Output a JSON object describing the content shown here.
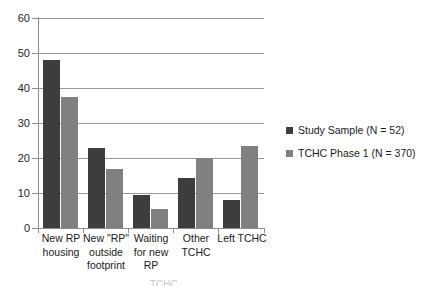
{
  "chart_data": {
    "type": "bar",
    "title": "",
    "xlabel": "",
    "ylabel": "",
    "ylim": [
      0,
      60
    ],
    "yticks": [
      0,
      10,
      20,
      30,
      40,
      50,
      60
    ],
    "grid": true,
    "legend_position": "right",
    "categories": [
      "New RP housing",
      "New \"RP\" outside footprint",
      "Waiting for new RP",
      "Other TCHC",
      "Left TCHC"
    ],
    "category_lines": [
      [
        "New RP",
        "housing"
      ],
      [
        "New \"RP\"",
        "outside",
        "footprint"
      ],
      [
        "Waiting",
        "for new",
        "RP"
      ],
      [
        "Other",
        "TCHC"
      ],
      [
        "Left TCHC"
      ]
    ],
    "series": [
      {
        "name": "Study Sample (N = 52)",
        "color": "#3d3d3d",
        "values": [
          48,
          23,
          9.5,
          14.3,
          8
        ]
      },
      {
        "name": "TCHC Phase 1 (N = 370)",
        "color": "#808080",
        "values": [
          37.5,
          17,
          5.5,
          20,
          23.3
        ]
      }
    ]
  },
  "legend": {
    "items": [
      {
        "label": "Study Sample (N = 52)",
        "color": "#3d3d3d"
      },
      {
        "label": "TCHC Phase 1 (N = 370)",
        "color": "#808080"
      }
    ]
  },
  "caption": {
    "text": "TCHC"
  }
}
